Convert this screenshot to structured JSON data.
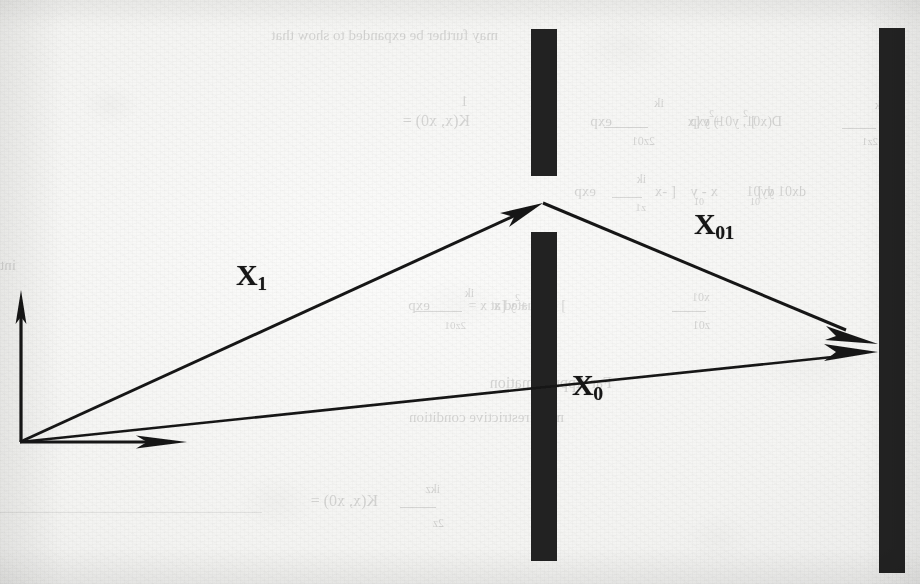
{
  "figure": {
    "kind": "scanned-textbook-figure",
    "background_color": "#f2f2f0",
    "ink_color": "#161616"
  },
  "axes": {
    "origin_label": "",
    "vertical_axis_name": "vertical-axis",
    "horizontal_axis_name": "horizontal-axis"
  },
  "labels": [
    {
      "id": "x1",
      "base": "X",
      "sub": "1",
      "text": "X1",
      "x": 236,
      "y": 273,
      "size": 30
    },
    {
      "id": "x01",
      "base": "X",
      "sub": "01",
      "text": "X01",
      "x": 694,
      "y": 222,
      "size": 30
    },
    {
      "id": "x0",
      "base": "X",
      "sub": "0",
      "text": "X0",
      "x": 572,
      "y": 383,
      "size": 30
    }
  ],
  "barriers": [
    {
      "id": "barrier-1-upper",
      "x": 531,
      "y": 29,
      "width": 26,
      "height": 147
    },
    {
      "id": "barrier-1-lower",
      "x": 531,
      "y": 232,
      "width": 26,
      "height": 329
    },
    {
      "id": "barrier-2",
      "x": 879,
      "y": 28,
      "width": 26,
      "height": 545
    }
  ],
  "rays": [
    {
      "id": "ray-x1",
      "from": [
        20,
        442
      ],
      "to": [
        543,
        203
      ],
      "label": "X1"
    },
    {
      "id": "ray-x01",
      "from": [
        543,
        203
      ],
      "to": [
        878,
        344
      ],
      "label": "X01"
    },
    {
      "id": "ray-x0",
      "from": [
        20,
        442
      ],
      "to": [
        878,
        352
      ],
      "label": "X0"
    }
  ],
  "showthrough_text": {
    "note": "Faint mirrored text bleeding through from the reverse page",
    "lines": [
      {
        "text": "may further be expanded to show that",
        "x": 498,
        "y": 42,
        "size": 15
      },
      {
        "text": "1",
        "x": 468,
        "y": 108,
        "size": 14
      },
      {
        "text": "K(x, x0)  =",
        "x": 470,
        "y": 128,
        "size": 16
      },
      {
        "text": "exp",
        "x": 612,
        "y": 128,
        "size": 15
      },
      {
        "text": "ik",
        "x": 664,
        "y": 108,
        "size": 13
      },
      {
        "text": "2z01",
        "x": 655,
        "y": 146,
        "size": 12
      },
      {
        "text": "[x",
        "x": 700,
        "y": 128,
        "size": 15
      },
      {
        "text": "2",
        "x": 714,
        "y": 118,
        "size": 10
      },
      {
        "text": "+ y",
        "x": 722,
        "y": 128,
        "size": 15
      },
      {
        "text": "2",
        "x": 748,
        "y": 118,
        "size": 10
      },
      {
        "text": "]",
        "x": 756,
        "y": 128,
        "size": 15
      },
      {
        "text": "D(x01, y01) exp",
        "x": 782,
        "y": 128,
        "size": 14
      },
      {
        "text": "ik",
        "x": 884,
        "y": 110,
        "size": 12
      },
      {
        "text": "2z1",
        "x": 878,
        "y": 146,
        "size": 11
      },
      {
        "text": "[x",
        "x": 902,
        "y": 128,
        "size": 14
      },
      {
        "text": "exp",
        "x": 596,
        "y": 198,
        "size": 15
      },
      {
        "text": "ik",
        "x": 646,
        "y": 184,
        "size": 12
      },
      {
        "text": "z1",
        "x": 646,
        "y": 212,
        "size": 11
      },
      {
        "text": "[ -x",
        "x": 676,
        "y": 198,
        "size": 15
      },
      {
        "text": "01",
        "x": 704,
        "y": 206,
        "size": 10
      },
      {
        "text": "x - y",
        "x": 718,
        "y": 198,
        "size": 15
      },
      {
        "text": "01",
        "x": 760,
        "y": 206,
        "size": 10
      },
      {
        "text": "y ]",
        "x": 774,
        "y": 198,
        "size": 15
      },
      {
        "text": "dx01 dy01",
        "x": 806,
        "y": 198,
        "size": 14
      },
      {
        "text": "integral are over infinite, this is the 2D Fourier transform",
        "x": 16,
        "y": 272,
        "size": 15
      },
      {
        "text": "exp",
        "x": 430,
        "y": 312,
        "size": 15
      },
      {
        "text": "ik",
        "x": 474,
        "y": 298,
        "size": 12
      },
      {
        "text": "2z01",
        "x": 466,
        "y": 330,
        "size": 11
      },
      {
        "text": "[x",
        "x": 506,
        "y": 312,
        "size": 15
      },
      {
        "text": "2",
        "x": 520,
        "y": 302,
        "size": 10
      },
      {
        "text": "+ y",
        "x": 528,
        "y": 312,
        "size": 15
      },
      {
        "text": "2",
        "x": 556,
        "y": 312,
        "size": 10
      },
      {
        "text": "] evaluated at  x =",
        "x": 566,
        "y": 312,
        "size": 14
      },
      {
        "text": "x01",
        "x": 710,
        "y": 302,
        "size": 12
      },
      {
        "text": "z01",
        "x": 710,
        "y": 330,
        "size": 12
      },
      {
        "text": "Far Approximation",
        "x": 612,
        "y": 390,
        "size": 16
      },
      {
        "text": "more restrictive condition",
        "x": 564,
        "y": 424,
        "size": 15
      },
      {
        "text": "K(x, x0) =",
        "x": 378,
        "y": 508,
        "size": 16
      },
      {
        "text": "ikz",
        "x": 440,
        "y": 494,
        "size": 12
      },
      {
        "text": "2z",
        "x": 444,
        "y": 528,
        "size": 12
      }
    ]
  }
}
